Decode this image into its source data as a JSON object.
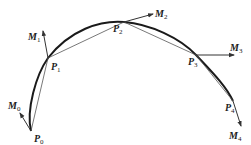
{
  "diagram": {
    "type": "curve-approximation",
    "colors": {
      "curve": "#1a1a1a",
      "chord": "#555555",
      "vector": "#333333"
    },
    "points": [
      {
        "name": "P",
        "sub": "0",
        "x": 31,
        "y": 131
      },
      {
        "name": "P",
        "sub": "1",
        "x": 48,
        "y": 58
      },
      {
        "name": "P",
        "sub": "2",
        "x": 124,
        "y": 22
      },
      {
        "name": "P",
        "sub": "3",
        "x": 196,
        "y": 55
      },
      {
        "name": "P",
        "sub": "4",
        "x": 233,
        "y": 101
      }
    ],
    "vectors": [
      {
        "name": "M",
        "sub": "0"
      },
      {
        "name": "M",
        "sub": "1"
      },
      {
        "name": "M",
        "sub": "2"
      },
      {
        "name": "M",
        "sub": "3"
      },
      {
        "name": "M",
        "sub": "4"
      }
    ]
  }
}
